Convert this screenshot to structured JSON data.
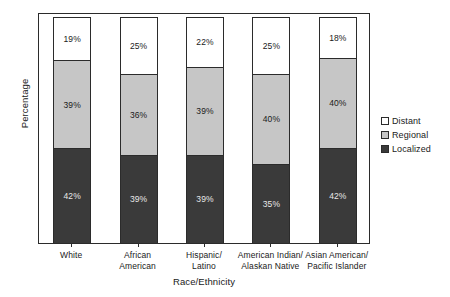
{
  "chart_data": {
    "type": "bar",
    "subtype": "stacked-100-percent",
    "title": "",
    "xlabel": "Race/Ethnicity",
    "ylabel": "Percentage",
    "ylim": [
      0,
      100
    ],
    "grid": false,
    "legend_position": "right",
    "categories": [
      "White",
      "African American",
      "Hispanic/ Latino",
      "American Indian/ Alaskan Native",
      "Asian American/ Pacific Islander"
    ],
    "category_lines": [
      [
        "White"
      ],
      [
        "African",
        "American"
      ],
      [
        "Hispanic/",
        "Latino"
      ],
      [
        "American Indian/",
        "Alaskan Native"
      ],
      [
        "Asian American/",
        "Pacific Islander"
      ]
    ],
    "series": [
      {
        "name": "Distant",
        "color": "#ffffff",
        "values": [
          19,
          25,
          22,
          25,
          18
        ],
        "labels": [
          "19%",
          "25%",
          "22%",
          "25%",
          "18%"
        ]
      },
      {
        "name": "Regional",
        "color": "#c6c6c6",
        "values": [
          39,
          36,
          39,
          40,
          40
        ],
        "labels": [
          "39%",
          "36%",
          "39%",
          "40%",
          "40%"
        ]
      },
      {
        "name": "Localized",
        "color": "#3a3a3a",
        "values": [
          42,
          39,
          39,
          35,
          42
        ],
        "labels": [
          "42%",
          "39%",
          "39%",
          "35%",
          "42%"
        ]
      }
    ]
  },
  "axes": {
    "y_title": "Percentage",
    "x_title": "Race/Ethnicity"
  },
  "legend": {
    "items": [
      {
        "label": "Distant",
        "color": "#ffffff"
      },
      {
        "label": "Regional",
        "color": "#c6c6c6"
      },
      {
        "label": "Localized",
        "color": "#3a3a3a"
      }
    ]
  }
}
